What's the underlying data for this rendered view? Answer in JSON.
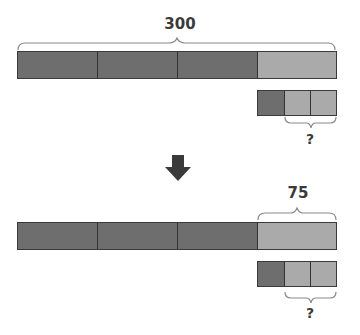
{
  "diagram": {
    "top": {
      "total_label": "300",
      "bar_segments": [
        "dark",
        "dark",
        "dark",
        "light"
      ],
      "small_bar_segments": [
        "dark",
        "light",
        "light"
      ],
      "question_label": "?"
    },
    "arrow": "down-arrow",
    "bottom": {
      "part_label": "75",
      "bar_segments": [
        "dark",
        "dark",
        "dark",
        "light"
      ],
      "small_bar_segments": [
        "dark",
        "light",
        "light"
      ],
      "question_label": "?"
    },
    "colors": {
      "dark": "#6e6e6e",
      "light": "#aaaaaa",
      "text": "#3a3a3a"
    }
  }
}
